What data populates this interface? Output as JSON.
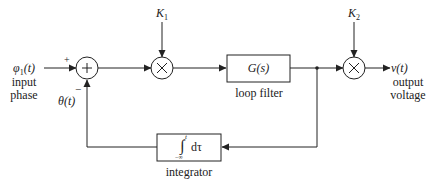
{
  "diagram": {
    "input": {
      "symbol": "φ1(t)",
      "symbol_main": "φ",
      "symbol_sub": "1",
      "symbol_arg": "(t)",
      "label_line1": "input",
      "label_line2": "phase"
    },
    "summer": {
      "plus": "+",
      "minus": "−",
      "glyph": "+"
    },
    "feedback_signal": "θ(t)",
    "gain1": {
      "label_main": "K",
      "label_sub": "1",
      "glyph": "×"
    },
    "gain2": {
      "label_main": "K",
      "label_sub": "2",
      "glyph": "×"
    },
    "loop_filter": {
      "content": "G(s)",
      "caption": "loop filter"
    },
    "integrator": {
      "upper_limit": "t",
      "lower_limit": "−∞",
      "content": "dτ",
      "integral_glyph": "∫",
      "caption": "integrator"
    },
    "output": {
      "symbol": "v(t)",
      "label_line1": "output",
      "label_line2": "voltage"
    }
  }
}
